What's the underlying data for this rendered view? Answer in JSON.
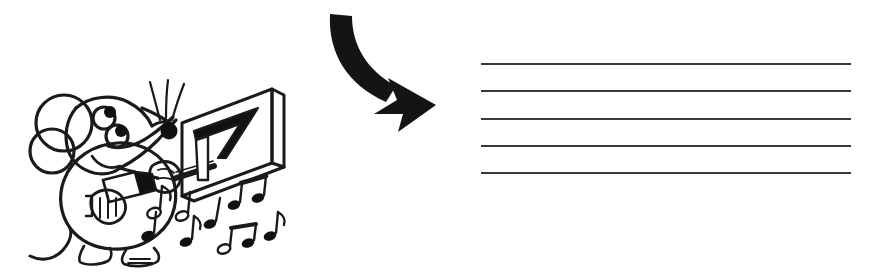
{
  "page": {
    "background_color": "#ffffff",
    "ink_color": "#1a1a1a",
    "staff_line_color": "#3a3a3a",
    "width": 875,
    "height": 275
  },
  "illustration": {
    "name": "cartoon-mouse-carving-board",
    "description": "Black and white line-art cartoon mouse holding a tool, working on a 3D board, with music notes floating around",
    "subject": "mouse",
    "features": [
      "round-ear",
      "inner-ear-ring",
      "two-eyes-with-black-pupils",
      "long-snout",
      "black-nose-tip",
      "three-whiskers",
      "smiling-mouth",
      "round-body",
      "two-hands-gripping-tool",
      "curled-tail",
      "splayed-feet"
    ],
    "tool": "carving-tool",
    "board": {
      "name": "perspective-board",
      "engraving": "triangular-seven-shape",
      "style": "3d-slab"
    },
    "music_notes": [
      {
        "id": 1,
        "type": "quarter-note",
        "x": 158,
        "y": 195
      },
      {
        "id": 2,
        "type": "quarter-note",
        "x": 150,
        "y": 228
      },
      {
        "id": 3,
        "type": "quarter-note",
        "x": 188,
        "y": 232
      },
      {
        "id": 4,
        "type": "half-note",
        "x": 183,
        "y": 212
      },
      {
        "id": 5,
        "type": "eighth-note",
        "x": 214,
        "y": 215
      },
      {
        "id": 6,
        "type": "beamed-eighth-pair",
        "x": 243,
        "y": 196
      },
      {
        "id": 7,
        "type": "beamed-eighth-pair",
        "x": 228,
        "y": 240
      },
      {
        "id": 8,
        "type": "eighth-note",
        "x": 258,
        "y": 234
      },
      {
        "id": 9,
        "type": "eighth-note",
        "x": 272,
        "y": 226
      }
    ]
  },
  "arrow": {
    "name": "curved-flow-arrow",
    "direction": "down-right",
    "style": "thick-curved-swallowtail",
    "color": "#141414"
  },
  "staff": {
    "name": "blank-music-staff",
    "line_count": 5,
    "lines": [
      {
        "index": 1,
        "y": 63
      },
      {
        "index": 2,
        "y": 90
      },
      {
        "index": 3,
        "y": 118
      },
      {
        "index": 4,
        "y": 145
      },
      {
        "index": 5,
        "y": 172
      }
    ],
    "notes": [],
    "clef": "",
    "time_signature": ""
  }
}
